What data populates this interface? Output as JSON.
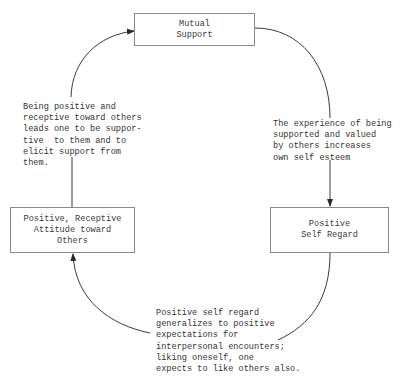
{
  "diagram": {
    "nodes": {
      "mutual_support": {
        "label": "Mutual\nSupport"
      },
      "positive_self_regard": {
        "label": "Positive\nSelf Regard"
      },
      "positive_receptive_attitude": {
        "label": "Positive, Receptive\nAttitude toward\nOthers"
      }
    },
    "edges": [
      {
        "from": "mutual_support",
        "to": "positive_self_regard",
        "annotation": "The experience of being\nsupported and valued\nby others increases\nown self esteem"
      },
      {
        "from": "positive_self_regard",
        "to": "positive_receptive_attitude",
        "annotation": "Positive self regard\ngeneralizes to positive\nexpectations for\ninterpersonal encounters;\nliking oneself, one\nexpects to like others also."
      },
      {
        "from": "positive_receptive_attitude",
        "to": "mutual_support",
        "annotation": "Being positive and\nreceptive toward others\nleads one to be suppor-\ntive  to them and to\nelicit support from\nthem."
      }
    ],
    "colors": {
      "line": "#3a3a3a",
      "box_border": "#8a8a8a",
      "text": "#333333"
    }
  }
}
